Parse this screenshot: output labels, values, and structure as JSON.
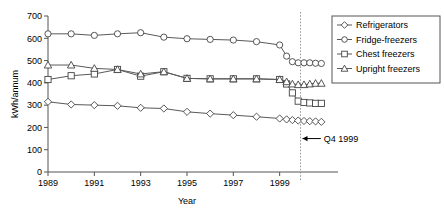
{
  "chart_data": {
    "type": "line",
    "title": "",
    "xlabel": "Year",
    "ylabel": "kWh/annum",
    "xlim": [
      1989,
      2001
    ],
    "ylim": [
      0,
      700
    ],
    "ytick_step": 100,
    "yticks": [
      "0",
      "100",
      "200",
      "300",
      "400",
      "500",
      "600",
      "700"
    ],
    "xticks": [
      "1989",
      "1991",
      "1993",
      "1995",
      "1997",
      "1999"
    ],
    "xtick_values": [
      1989,
      1991,
      1993,
      1995,
      1997,
      1999
    ],
    "grid": false,
    "legend_position": "top-right",
    "annotations": [
      {
        "text": "Q4 1999",
        "x": 2000.0,
        "y": 150,
        "points_to_x": 1999.9
      }
    ],
    "vertical_reference_line": {
      "x": 1999.9,
      "style": "dotted",
      "label": "Q4 1999"
    },
    "series": [
      {
        "name": "Refrigerators",
        "marker": "diamond",
        "x": [
          1989.0,
          1990.0,
          1991.0,
          1992.0,
          1993.0,
          1994.0,
          1995.0,
          1996.0,
          1997.0,
          1998.0,
          1999.0,
          1999.3,
          1999.55,
          1999.8,
          2000.05,
          2000.3,
          2000.55,
          2000.8
        ],
        "y": [
          315,
          303,
          300,
          297,
          288,
          285,
          270,
          262,
          255,
          248,
          240,
          236,
          233,
          231,
          229,
          228,
          227,
          225
        ]
      },
      {
        "name": "Fridge-freezers",
        "marker": "circle",
        "x": [
          1989.0,
          1990.0,
          1991.0,
          1992.0,
          1993.0,
          1994.0,
          1995.0,
          1996.0,
          1997.0,
          1998.0,
          1999.0,
          1999.3,
          1999.55,
          1999.8,
          2000.05,
          2000.3,
          2000.55,
          2000.8
        ],
        "y": [
          620,
          620,
          613,
          620,
          625,
          605,
          598,
          595,
          592,
          585,
          570,
          520,
          495,
          490,
          490,
          490,
          488,
          487
        ]
      },
      {
        "name": "Chest freezers",
        "marker": "square",
        "x": [
          1989.0,
          1990.0,
          1991.0,
          1992.0,
          1993.0,
          1994.0,
          1995.0,
          1996.0,
          1997.0,
          1998.0,
          1999.0,
          1999.3,
          1999.55,
          1999.8,
          2000.05,
          2000.3,
          2000.55,
          2000.8
        ],
        "y": [
          415,
          432,
          440,
          460,
          430,
          450,
          420,
          418,
          418,
          418,
          415,
          395,
          355,
          318,
          312,
          310,
          308,
          308
        ]
      },
      {
        "name": "Upright freezers",
        "marker": "triangle",
        "x": [
          1989.0,
          1990.0,
          1991.0,
          1992.0,
          1993.0,
          1994.0,
          1995.0,
          1996.0,
          1997.0,
          1998.0,
          1999.0,
          1999.3,
          1999.55,
          1999.8,
          2000.05,
          2000.3,
          2000.55,
          2000.8
        ],
        "y": [
          480,
          480,
          465,
          460,
          440,
          450,
          420,
          418,
          418,
          418,
          415,
          405,
          395,
          392,
          392,
          395,
          398,
          398
        ]
      }
    ]
  },
  "legend": {
    "items": [
      {
        "label": "Refrigerators",
        "marker": "diamond"
      },
      {
        "label": "Fridge-freezers",
        "marker": "circle"
      },
      {
        "label": "Chest freezers",
        "marker": "square"
      },
      {
        "label": "Upright freezers",
        "marker": "triangle"
      }
    ]
  },
  "colors": {
    "line": "#595959",
    "marker_fill": "#ffffff",
    "marker_stroke": "#444444",
    "axis": "#555555",
    "text": "#000000",
    "dashed_reference": "#999999"
  }
}
